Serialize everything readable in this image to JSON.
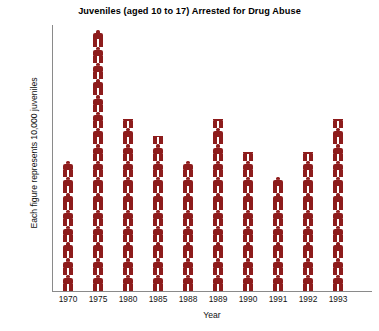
{
  "chart_data": {
    "type": "bar",
    "subtype": "pictograph",
    "title": "Juveniles (aged 10 to 17) Arrested for Drug Abuse",
    "xlabel": "Year",
    "ylabel": "Each figure represents 10,000 juveniles",
    "unit_per_figure": 10000,
    "grid": false,
    "legend": false,
    "ylim": [
      0,
      16
    ],
    "categories": [
      "1970",
      "1975",
      "1980",
      "1985",
      "1988",
      "1989",
      "1990",
      "1991",
      "1992",
      "1993"
    ],
    "values": [
      8,
      16,
      10.5,
      9.5,
      8,
      10.5,
      8.5,
      7,
      8.5,
      10.5
    ],
    "values_in_juveniles": [
      80000,
      160000,
      105000,
      95000,
      80000,
      105000,
      85000,
      70000,
      85000,
      105000
    ],
    "series": [
      {
        "name": "Juveniles arrested for drug abuse",
        "values": [
          8,
          16,
          10.5,
          9.5,
          8,
          10.5,
          8.5,
          7,
          8.5,
          10.5
        ]
      }
    ],
    "colors": {
      "figure": "#8d1c1c",
      "axis": "#8a8a8a",
      "text": "#111111",
      "background": "#ffffff"
    }
  },
  "title": "Juveniles (aged 10 to 17) Arrested for Drug Abuse",
  "axes": {
    "x_label": "Year",
    "y_label": "Each figure represents 10,000 juveniles",
    "x_ticks": [
      "1970",
      "1975",
      "1980",
      "1985",
      "1988",
      "1989",
      "1990",
      "1991",
      "1992",
      "1993"
    ]
  }
}
